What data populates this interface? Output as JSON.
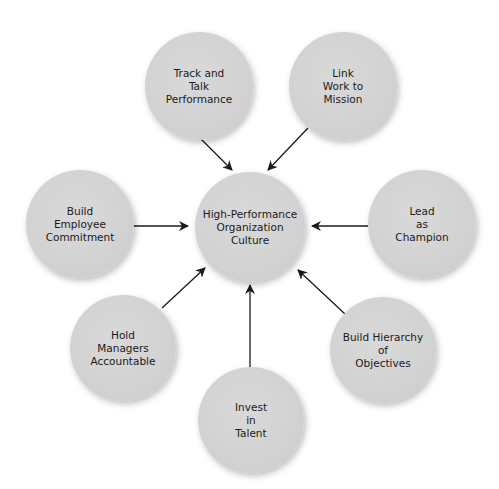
{
  "diagram": {
    "type": "hub-and-spoke",
    "center": {
      "label": "High-Performance\nOrganization\nCulture"
    },
    "nodes": [
      {
        "id": "track",
        "label": "Track and\nTalk\nPerformance"
      },
      {
        "id": "link",
        "label": "Link\nWork to\nMission"
      },
      {
        "id": "commit",
        "label": "Build\nEmployee\nCommitment"
      },
      {
        "id": "lead",
        "label": "Lead\nas\nChampion"
      },
      {
        "id": "hold",
        "label": "Hold\nManagers\nAccountable"
      },
      {
        "id": "hier",
        "label": "Build Hierarchy\nof\nObjectives"
      },
      {
        "id": "invest",
        "label": "Invest\nin\nTalent"
      }
    ],
    "edges": [
      {
        "from": "track",
        "to": "center"
      },
      {
        "from": "link",
        "to": "center"
      },
      {
        "from": "commit",
        "to": "center"
      },
      {
        "from": "lead",
        "to": "center"
      },
      {
        "from": "hold",
        "to": "center"
      },
      {
        "from": "hier",
        "to": "center"
      },
      {
        "from": "invest",
        "to": "center"
      }
    ],
    "colors": {
      "node_fill": "#d3d3d3",
      "arrow": "#1a1a1a",
      "text": "#1a1a1a",
      "background": "#ffffff"
    }
  }
}
